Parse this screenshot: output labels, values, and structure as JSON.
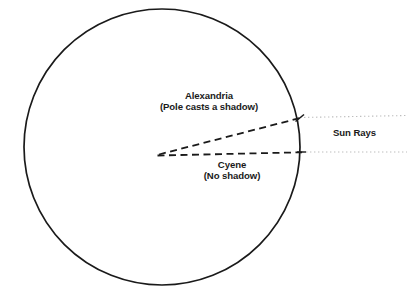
{
  "figure": {
    "background_color": "#ffffff",
    "ink_color": "#1a1a1a",
    "ray_color": "#b9b9b9"
  },
  "earth": {
    "name": "Earth circle",
    "center_x": 162,
    "center_y": 147,
    "radius": 138,
    "stroke_color": "#1a1a1a",
    "stroke_width": 1.6
  },
  "labels": {
    "alexandria": {
      "name": "Alexandria",
      "line1": "Alexandria",
      "line2": "(Pole casts a shadow)"
    },
    "cyene": {
      "name": "Cyene",
      "line1": "Cyene",
      "line2": "(No shadow)"
    },
    "sun_rays": {
      "text": "Sun Rays"
    }
  },
  "rays": [
    {
      "name": "sun-ray-alexandria",
      "x1": 299,
      "y1": 118,
      "x2": 406,
      "y2": 116,
      "style": "dotted",
      "color": "#b9b9b9"
    },
    {
      "name": "sun-ray-cyene",
      "x1": 301,
      "y1": 152,
      "x2": 406,
      "y2": 152,
      "style": "dotted",
      "color": "#b9b9b9"
    }
  ],
  "radii": [
    {
      "name": "radius-to-alexandria",
      "x1": 158,
      "y1": 154,
      "x2": 300,
      "y2": 118,
      "style": "dashed"
    },
    {
      "name": "radius-to-cyene",
      "x1": 157,
      "y1": 155,
      "x2": 301,
      "y2": 152,
      "style": "dashed"
    }
  ],
  "markers": {
    "alexandria_tick": {
      "x": 299,
      "y": 118
    },
    "cyene_tick": {
      "x": 301,
      "y": 152
    }
  }
}
